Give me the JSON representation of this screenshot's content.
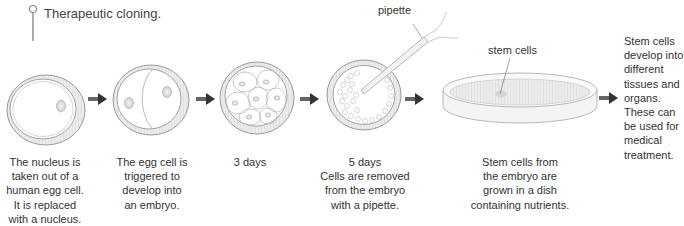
{
  "title": "Therapeutic cloning.",
  "labels": {
    "pipette": "pipette",
    "stem_cells": "stem cells"
  },
  "steps": [
    {
      "id": "nucleus-replaced",
      "image": "egg-cell-icon",
      "caption": "The nucleus is\ntaken out of a\nhuman egg cell.\nIt is replaced\nwith a nucleus."
    },
    {
      "id": "embryo-triggered",
      "image": "dividing-egg-cell-icon",
      "caption": "The egg cell is\ntriggered to\ndevelop into\nan embryo."
    },
    {
      "id": "three-days",
      "image": "multicell-embryo-icon",
      "caption": "3 days"
    },
    {
      "id": "five-days",
      "image": "blastocyst-with-pipette-icon",
      "caption": "5 days\nCells are removed\nfrom the embryo\nwith a pipette."
    },
    {
      "id": "dish",
      "image": "petri-dish-icon",
      "caption": "Stem cells from\nthe embryo are\ngrown in a dish\ncontaining nutrients."
    },
    {
      "id": "treatment",
      "image": null,
      "caption": "Stem cells\ndevelop into\ndifferent\ntissues and\norgans.\nThese can\nbe used for\nmedical\ntreatment."
    }
  ],
  "colors": {
    "outline": "#9a9a9a",
    "membrane_fill": "#e6e6e6",
    "arrow": "#444444",
    "text": "#333333"
  }
}
